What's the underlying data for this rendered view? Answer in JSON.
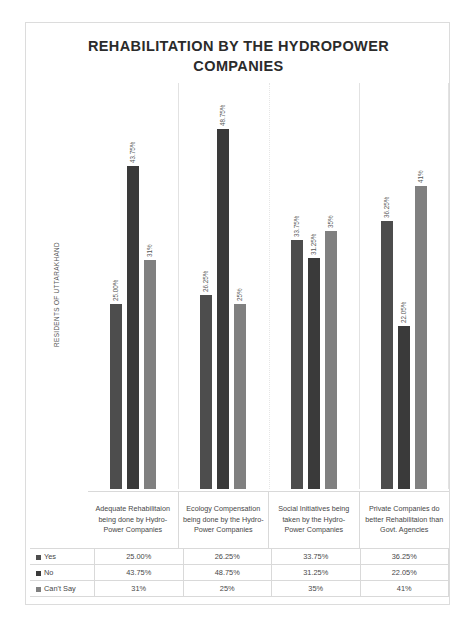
{
  "chart_data": {
    "type": "bar",
    "title": "REHABILITATION BY THE HYDROPOWER COMPANIES",
    "xlabel": "",
    "ylabel": "RESIDENTS OF UTTARAKHAND",
    "grid": false,
    "legend_position": "table-left-column",
    "ylim": [
      0,
      55
    ],
    "categories": [
      "Adequate Rehabilitaion being done by Hydro-Power Companies",
      "Ecology Compensation being done by the Hydro-Power Companies",
      "Social Initiatives being taken by the Hydro-Power Companies",
      "Private Companies do better Rehabilitaion than Govt. Agencies"
    ],
    "series": [
      {
        "name": "Yes",
        "color": "#4d4d4d",
        "values": [
          25.0,
          26.25,
          33.75,
          36.25
        ],
        "labels": [
          "25.00%",
          "26.25%",
          "33.75%",
          "36.25%"
        ]
      },
      {
        "name": "No",
        "color": "#3a3a3a",
        "values": [
          43.75,
          48.75,
          31.25,
          22.05
        ],
        "labels": [
          "43.75%",
          "48.75%",
          "31.25%",
          "22.05%"
        ]
      },
      {
        "name": "Can't Say",
        "color": "#808080",
        "values": [
          31,
          25,
          35,
          41
        ],
        "labels": [
          "31%",
          "25%",
          "35%",
          "41%"
        ]
      }
    ]
  },
  "table": {
    "rows": [
      {
        "label": "Yes",
        "swatch": "#4d4d4d",
        "cells": [
          "25.00%",
          "26.25%",
          "33.75%",
          "36.25%"
        ]
      },
      {
        "label": "No",
        "swatch": "#3a3a3a",
        "cells": [
          "43.75%",
          "48.75%",
          "31.25%",
          "22.05%"
        ]
      },
      {
        "label": "Can't Say",
        "swatch": "#808080",
        "cells": [
          "31%",
          "25%",
          "35%",
          "41%"
        ]
      }
    ]
  }
}
